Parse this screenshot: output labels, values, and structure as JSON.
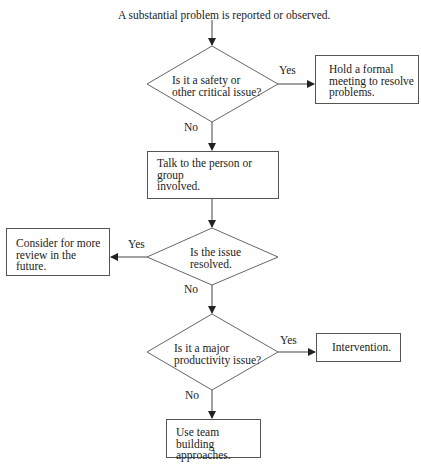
{
  "flowchart": {
    "start": "A substantial problem is reported or observed.",
    "decisions": [
      {
        "id": "d1",
        "text": "Is it a safety or\nother critical issue?",
        "yes": "Yes",
        "no": "No"
      },
      {
        "id": "d2",
        "text": "Is the issue\nresolved.",
        "yes": "Yes",
        "no": "No"
      },
      {
        "id": "d3",
        "text": "Is it a major\nproductivity issue?",
        "yes": "Yes",
        "no": "No"
      }
    ],
    "actions": [
      {
        "id": "a1",
        "text": "Hold a formal\nmeeting to resolve\nproblems."
      },
      {
        "id": "a2",
        "text": "Talk to the person or group\ninvolved."
      },
      {
        "id": "a3",
        "text": "Consider for more\nreview in the future."
      },
      {
        "id": "a4",
        "text": "Intervention."
      },
      {
        "id": "a5",
        "text": "Use team building\napproaches."
      }
    ]
  }
}
